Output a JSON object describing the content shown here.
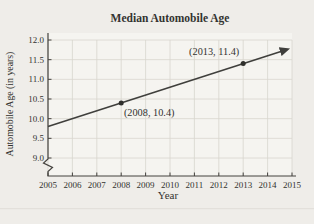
{
  "chart_data": {
    "type": "line",
    "title": "Median Automobile Age",
    "xlabel": "Year",
    "ylabel": "Automobile Age (in years)",
    "xlim": [
      2005,
      2015
    ],
    "ylim": [
      9.0,
      12.0
    ],
    "x_ticks": [
      2005,
      2006,
      2007,
      2008,
      2009,
      2010,
      2011,
      2012,
      2013,
      2014,
      2015
    ],
    "x_tick_labels": [
      "2005",
      "2006",
      "2007",
      "2008",
      "2009",
      "2010",
      "2011",
      "2012",
      "2013",
      "2014",
      "2015"
    ],
    "y_ticks": [
      12.0,
      11.5,
      11.0,
      10.5,
      10.0,
      9.5,
      9.0
    ],
    "y_tick_labels": [
      "12.0",
      "11.5",
      "11.0",
      "10.5",
      "10.0",
      "9.5",
      "9.0"
    ],
    "y_axis_break": true,
    "grid": true,
    "legend": "none",
    "line": {
      "x": [
        2005,
        2014.8
      ],
      "y": [
        9.8,
        11.76
      ],
      "slope_per_year": 0.2,
      "arrow_end": true,
      "color": "#3f3f3c"
    },
    "points": [
      {
        "x": 2008,
        "y": 10.4,
        "label": "(2008, 10.4)",
        "label_position": "below-right"
      },
      {
        "x": 2013,
        "y": 11.4,
        "label": "(2013, 11.4)",
        "label_position": "above-left"
      }
    ],
    "colors": {
      "background": "#efede9",
      "plot_background": "#f5f4f0",
      "grid": "#d8d5ce",
      "axis": "#45433f",
      "text": "#333330",
      "point": "#2f2f2c"
    }
  }
}
